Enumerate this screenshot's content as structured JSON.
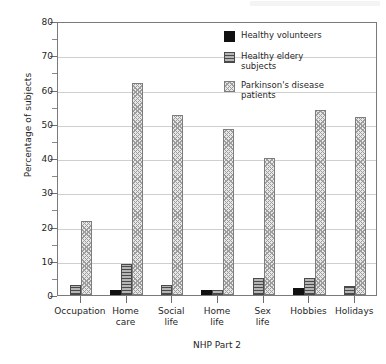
{
  "chart_data": {
    "type": "bar",
    "title": "",
    "xlabel": "NHP Part 2",
    "ylabel": "Percentage of subjects",
    "ylim": [
      0,
      80
    ],
    "ytick_step": 10,
    "yticks": [
      0,
      10,
      20,
      30,
      40,
      50,
      60,
      70,
      80
    ],
    "minor_tick_step": 5,
    "grid": true,
    "legend_position": "top-right",
    "categories": [
      "Occupation",
      "Home care",
      "Social life",
      "Home life",
      "Sex life",
      "Hobbies",
      "Holidays"
    ],
    "series": [
      {
        "name": "Healthy volunteers",
        "color": "#111111",
        "pattern": "solid",
        "values": [
          0,
          1.5,
          0,
          1.5,
          0,
          2,
          0
        ]
      },
      {
        "name": "Healthy eldery subjects",
        "color": "#9a9a9a",
        "pattern": "horizontal-lines",
        "values": [
          3,
          9,
          3,
          1.5,
          5,
          5,
          2.5
        ]
      },
      {
        "name": "Parkinson's disease patients",
        "color": "#e8e8e8",
        "pattern": "cross-hatch",
        "values": [
          21.5,
          62,
          52.5,
          48.5,
          40,
          54,
          52
        ]
      }
    ]
  },
  "legend": {
    "entries": [
      "Healthy volunteers",
      "Healthy eldery\nsubjects",
      "Parkinson's disease\npatients"
    ]
  },
  "axes": {
    "y_title": "Percentage of subjects",
    "x_title": "NHP Part 2",
    "y_tick_labels": [
      "80",
      "70",
      "60",
      "50",
      "40",
      "30",
      "20",
      "10",
      "0"
    ],
    "x_tick_labels": [
      "Occupation",
      "Home\ncare",
      "Social\nlife",
      "Home\nlife",
      "Sex\nlife",
      "Hobbies",
      "Holidays"
    ]
  }
}
